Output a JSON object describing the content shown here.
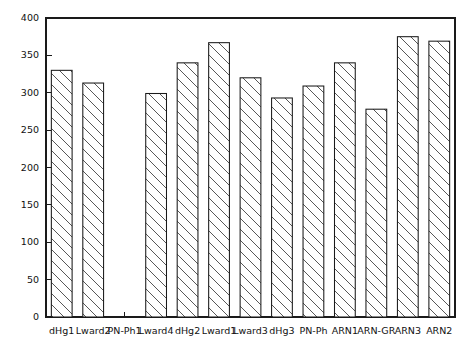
{
  "chart_data": {
    "type": "bar",
    "title": "",
    "subtitle": "",
    "xlabel": "",
    "ylabel": "",
    "categories": [
      "dHg1",
      "Lward2",
      "PN-Ph1",
      "Lward4",
      "dHg2",
      "Lward1",
      "Lward3",
      "dHg3",
      "PN-Ph",
      "ARN1",
      "ARN-GR",
      "ARN3",
      "ARN2"
    ],
    "values": [
      330,
      313,
      0,
      299,
      340,
      367,
      320,
      293,
      309,
      340,
      278,
      375,
      369
    ],
    "ylim": [
      0,
      400
    ],
    "yticks": [
      0,
      50,
      100,
      150,
      200,
      250,
      300,
      350,
      400
    ],
    "ytick_labels": [
      "0",
      "50",
      "100",
      "150",
      "200",
      "250",
      "300",
      "350",
      "400"
    ],
    "grid": false,
    "legend": null,
    "legend_position": "none",
    "bar_fill": "hatched-diagonal",
    "bar_edge_color": "#1a1a1a",
    "background_color": "#ffffff",
    "note": "Third category PN-Ph1 has no bar drawn (zero / missing value)"
  },
  "figure": {
    "frame_color": "#1a1a1a",
    "axis_box": "full-rectangle"
  }
}
